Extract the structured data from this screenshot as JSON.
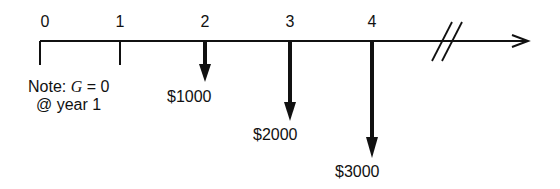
{
  "diagram": {
    "type": "cash-flow-timeline",
    "periods": [
      "0",
      "1",
      "2",
      "3",
      "4"
    ],
    "cash_flows": [
      {
        "period": "2",
        "label": "$1000",
        "direction": "down"
      },
      {
        "period": "3",
        "label": "$2000",
        "direction": "down"
      },
      {
        "period": "4",
        "label": "$3000",
        "direction": "down"
      }
    ],
    "note": {
      "prefix": "Note: ",
      "var": "G",
      "eq": " = 0",
      "line2": "@ year 1"
    }
  }
}
